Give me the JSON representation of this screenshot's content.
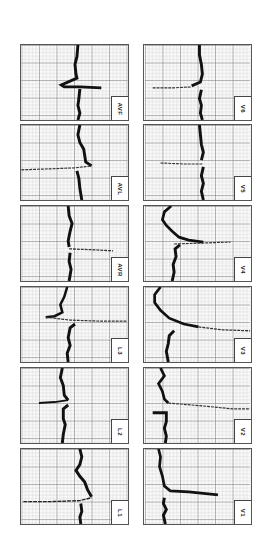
{
  "figure": {
    "grid": {
      "minor_color": "#c8c8c8",
      "major_color": "#7a7a7a",
      "trace_color": "#111111",
      "paper_color": "#fafafa"
    },
    "columns": [
      {
        "name": "limb-leads",
        "leads": [
          {
            "label": "AVF"
          },
          {
            "label": "AVL"
          },
          {
            "label": "AVR"
          },
          {
            "label": "L3"
          },
          {
            "label": "L2"
          },
          {
            "label": "L1"
          }
        ]
      },
      {
        "name": "precordial-leads",
        "leads": [
          {
            "label": "V6"
          },
          {
            "label": "V5"
          },
          {
            "label": "V4"
          },
          {
            "label": "V3"
          },
          {
            "label": "V2"
          },
          {
            "label": "V1"
          }
        ]
      }
    ]
  }
}
